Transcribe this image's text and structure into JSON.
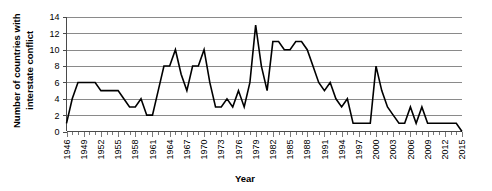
{
  "chart_data": {
    "type": "line",
    "title": "",
    "xlabel": "Year",
    "ylabel": "Number of countries with interstate conflict",
    "ylim": [
      0,
      14
    ],
    "ytick_step": 2,
    "yticks": [
      0,
      2,
      4,
      6,
      8,
      10,
      12,
      14
    ],
    "xlim": [
      1946,
      2015
    ],
    "xtick_step": 3,
    "xticks": [
      1946,
      1949,
      1952,
      1955,
      1958,
      1961,
      1964,
      1967,
      1970,
      1973,
      1976,
      1979,
      1982,
      1985,
      1988,
      1991,
      1994,
      1997,
      2000,
      2003,
      2006,
      2009,
      2012,
      2015
    ],
    "grid": "horizontal",
    "legend": "none",
    "line_color": "#000000",
    "grid_color": "#8a8a8a",
    "axis_color": "#4a4a4a",
    "x": [
      1946,
      1947,
      1948,
      1949,
      1950,
      1951,
      1952,
      1953,
      1954,
      1955,
      1956,
      1957,
      1958,
      1959,
      1960,
      1961,
      1962,
      1963,
      1964,
      1965,
      1966,
      1967,
      1968,
      1969,
      1970,
      1971,
      1972,
      1973,
      1974,
      1975,
      1976,
      1977,
      1978,
      1979,
      1980,
      1981,
      1982,
      1983,
      1984,
      1985,
      1986,
      1987,
      1988,
      1989,
      1990,
      1991,
      1992,
      1993,
      1994,
      1995,
      1996,
      1997,
      1998,
      1999,
      2000,
      2001,
      2002,
      2003,
      2004,
      2005,
      2006,
      2007,
      2008,
      2009,
      2010,
      2011,
      2012,
      2013,
      2014,
      2015
    ],
    "values": [
      1,
      4,
      6,
      6,
      6,
      6,
      5,
      5,
      5,
      5,
      4,
      3,
      3,
      4,
      2,
      2,
      5,
      8,
      8,
      10,
      7,
      5,
      8,
      8,
      10,
      6,
      3,
      3,
      4,
      3,
      5,
      3,
      6,
      13,
      8,
      5,
      11,
      11,
      10,
      10,
      11,
      11,
      10,
      8,
      6,
      5,
      6,
      4,
      3,
      4,
      1,
      1,
      1,
      1,
      8,
      5,
      3,
      2,
      1,
      1,
      3,
      1,
      3,
      1,
      1,
      1,
      1,
      1,
      1,
      0
    ],
    "series": [
      {
        "name": "Countries with interstate conflict",
        "values": [
          1,
          4,
          6,
          6,
          6,
          6,
          5,
          5,
          5,
          5,
          4,
          3,
          3,
          4,
          2,
          2,
          5,
          8,
          8,
          10,
          7,
          5,
          8,
          8,
          10,
          6,
          3,
          3,
          4,
          3,
          5,
          3,
          6,
          13,
          8,
          5,
          11,
          11,
          10,
          10,
          11,
          11,
          10,
          8,
          6,
          5,
          6,
          4,
          3,
          4,
          1,
          1,
          1,
          1,
          8,
          5,
          3,
          2,
          1,
          1,
          3,
          1,
          3,
          1,
          1,
          1,
          1,
          1,
          1,
          0
        ]
      }
    ],
    "annotations": []
  },
  "axes": {
    "y_title": "Number of countries with interstate conflict",
    "y_title_line1": "Number of countries with",
    "y_title_line2": "interstate conflict",
    "x_title": "Year"
  }
}
